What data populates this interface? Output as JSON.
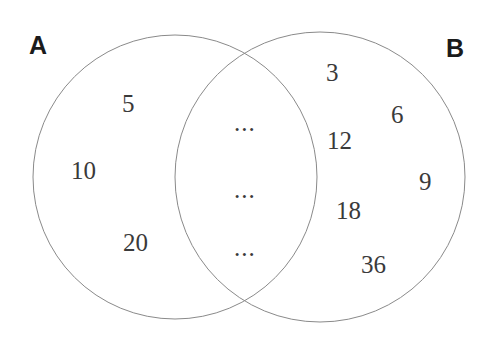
{
  "diagram": {
    "type": "venn",
    "title": "",
    "background_color": "#ffffff",
    "stroke_color": "#8a8a8a",
    "text_color": "#3a3a3a",
    "label_color": "#1b1b1b",
    "sets": [
      {
        "id": "A",
        "label": "A",
        "center_x": 175,
        "center_y": 177,
        "radius": 142
      },
      {
        "id": "B",
        "label": "B",
        "center_x": 320,
        "center_y": 177,
        "radius": 145
      }
    ],
    "regions": {
      "left_only": {
        "name": "A only",
        "members": [
          "5",
          "10",
          "20"
        ]
      },
      "intersection": {
        "name": "A and B",
        "members": [
          "...",
          "...",
          "..."
        ]
      },
      "right_only": {
        "name": "B only",
        "members": [
          "3",
          "6",
          "12",
          "9",
          "18",
          "36"
        ]
      }
    }
  }
}
